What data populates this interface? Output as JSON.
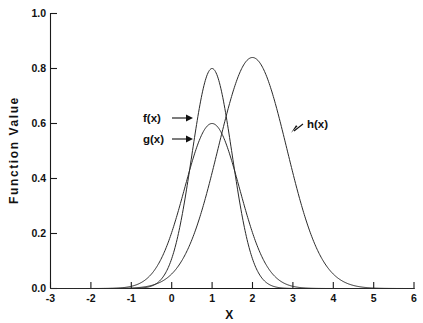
{
  "chart_data": {
    "type": "line",
    "title": "",
    "xlabel": "X",
    "ylabel": "Function Value",
    "xlim": [
      -3,
      6
    ],
    "ylim": [
      0.0,
      1.0
    ],
    "grid": false,
    "legend_position": "inline-annotations",
    "x_ticks": [
      "-3",
      "-2",
      "-1",
      "0",
      "1",
      "2",
      "3",
      "4",
      "5",
      "6"
    ],
    "x_tick_values": [
      -3,
      -2,
      -1,
      0,
      1,
      2,
      3,
      4,
      5,
      6
    ],
    "y_ticks": [
      "0.0",
      "0.2",
      "0.4",
      "0.6",
      "0.8",
      "1.0"
    ],
    "y_tick_values": [
      0.0,
      0.2,
      0.4,
      0.6,
      0.8,
      1.0
    ],
    "series": [
      {
        "name": "f(x)",
        "label": "f(x)",
        "peak_x": 1.0,
        "peak_y": 0.8,
        "sigma": 0.5,
        "color": "#2a2a2a",
        "x": [
          -3.0,
          -2.5,
          -2.0,
          -1.5,
          -1.25,
          -1.0,
          -0.75,
          -0.5,
          -0.25,
          0.0,
          0.25,
          0.5,
          0.75,
          1.0,
          1.25,
          1.5,
          1.75,
          2.0,
          2.25,
          2.5,
          2.75,
          3.0,
          3.25,
          3.5,
          4.0,
          4.5,
          5.0,
          5.5,
          6.0
        ],
        "values": [
          0.0,
          0.0,
          0.0,
          0.0009,
          0.0035,
          0.0108,
          0.0295,
          0.0716,
          0.1553,
          0.301,
          0.5218,
          0.8096,
          1.0,
          0.8,
          1.0,
          0.8096,
          0.5218,
          0.301,
          0.1553,
          0.0716,
          0.0295,
          0.0108,
          0.0035,
          0.0009,
          0.0,
          0.0,
          0.0,
          0.0,
          0.0
        ]
      },
      {
        "name": "g(x)",
        "label": "g(x)",
        "peak_x": 1.0,
        "peak_y": 0.6,
        "sigma": 0.68,
        "color": "#2a2a2a",
        "x": [
          -3.0,
          -2.5,
          -2.0,
          -1.5,
          -1.0,
          -0.5,
          0.0,
          0.5,
          1.0,
          1.5,
          2.0,
          2.5,
          3.0,
          3.5,
          4.0,
          4.5,
          5.0,
          5.5,
          6.0
        ],
        "values": [
          0.0,
          0.0,
          0.0005,
          0.0036,
          0.0187,
          0.0691,
          0.1825,
          0.3437,
          0.6,
          0.3437,
          0.1825,
          0.0691,
          0.0187,
          0.0036,
          0.0005,
          0.0,
          0.0,
          0.0,
          0.0
        ]
      },
      {
        "name": "h(x)",
        "label": "h(x)",
        "peak_x": 2.0,
        "peak_y": 0.84,
        "sigma": 0.85,
        "color": "#2a2a2a",
        "x": [
          -3.0,
          -2.5,
          -2.0,
          -1.5,
          -1.0,
          -0.5,
          0.0,
          0.5,
          1.0,
          1.5,
          2.0,
          2.5,
          3.0,
          3.5,
          4.0,
          4.5,
          5.0,
          5.5,
          6.0
        ],
        "values": [
          0.0,
          0.0,
          0.0,
          0.0006,
          0.0037,
          0.018,
          0.0668,
          0.19,
          0.4167,
          0.7046,
          0.84,
          0.7046,
          0.4167,
          0.19,
          0.0668,
          0.018,
          0.0037,
          0.0006,
          0.0
        ]
      }
    ],
    "annotations": [
      {
        "text": "f(x)",
        "x": 0.35,
        "y": 0.585,
        "arrow": "right"
      },
      {
        "text": "g(x)",
        "x": 0.35,
        "y": 0.455,
        "arrow": "right"
      },
      {
        "text": "h(x)",
        "x": 3.05,
        "y": 0.545,
        "arrow": "left-down"
      }
    ]
  },
  "axes": {
    "x_label": "X",
    "y_label": "Function Value"
  }
}
